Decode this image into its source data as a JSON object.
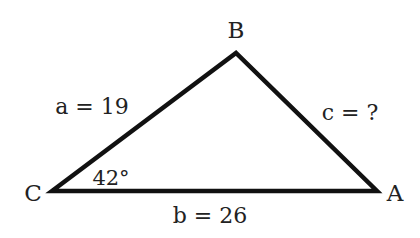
{
  "diagram": {
    "type": "triangle",
    "vertices": {
      "A": {
        "label": "A",
        "x": 377,
        "y": 191
      },
      "B": {
        "label": "B",
        "x": 236,
        "y": 53
      },
      "C": {
        "label": "C",
        "x": 52,
        "y": 191
      }
    },
    "sides": {
      "a": {
        "label": "a = 19"
      },
      "b": {
        "label": "b = 26"
      },
      "c": {
        "label": "c = ?"
      }
    },
    "angle_C": {
      "label": "42°"
    },
    "stroke_color": "#111111",
    "text_color": "#222222"
  }
}
